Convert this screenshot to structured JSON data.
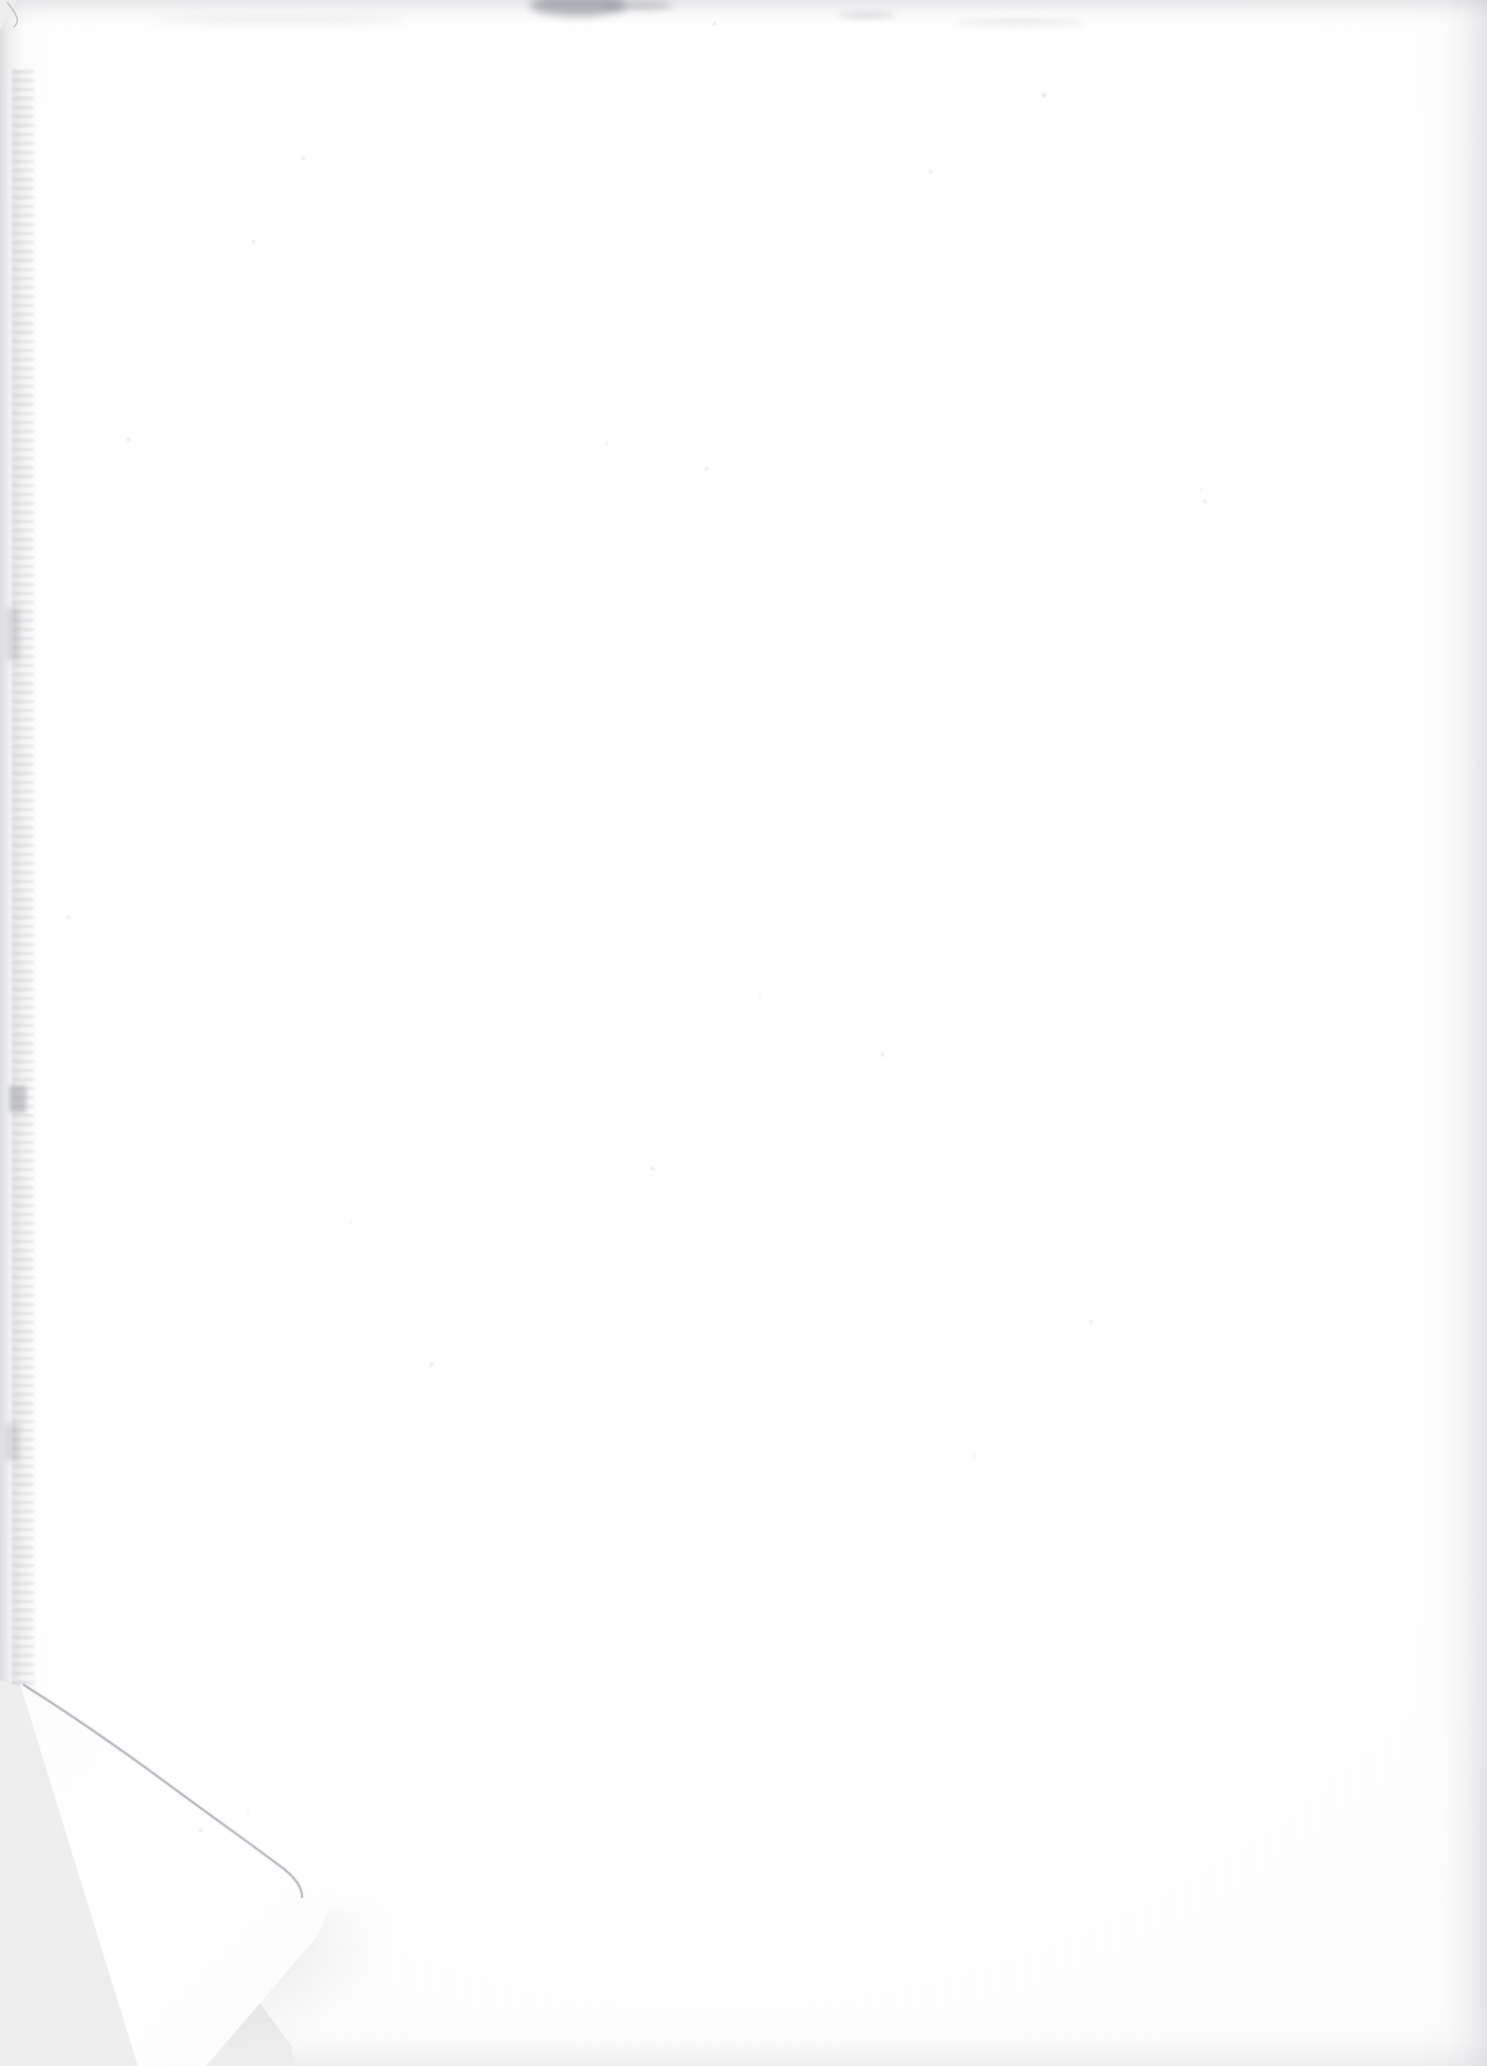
{
  "document": {
    "kind": "scanned-page",
    "page_content_text": "",
    "is_blank": true,
    "orientation": "portrait",
    "width_px": 1487,
    "height_px": 2066
  },
  "colors": {
    "paper_white": "#ffffff",
    "paper_tone": "#fdfdfd",
    "scanner_backdrop": "#eeeeee",
    "edge_shadow": "#c4c6ca",
    "fold_crease_line": "#9a9da4",
    "top_smudge": "#767a84",
    "left_grain": "#b0b2b7"
  },
  "artifacts": {
    "folded_corner": {
      "name": "bottom-left-folded-corner",
      "position": "bottom-left",
      "apex_x_px": 300,
      "apex_y_px": 1905,
      "hinge_x_px": 22,
      "hinge_y_px": 1686
    },
    "corner_nick": {
      "name": "top-left-corner-nick",
      "position": "top-left",
      "size_px": 30
    },
    "smudges": [
      {
        "name": "top-edge-dark-smudge",
        "x_px": 530,
        "y_px": 0,
        "width_px": 96
      },
      {
        "name": "top-edge-tail-smudge",
        "x_px": 600,
        "y_px": 1,
        "width_px": 74
      },
      {
        "name": "top-edge-right-streak",
        "x_px": 838,
        "y_px": 12,
        "width_px": 58
      },
      {
        "name": "top-edge-far-right-streak",
        "x_px": 955,
        "y_px": 20,
        "width_px": 130
      },
      {
        "name": "top-edge-left-streak",
        "x_px": 150,
        "y_px": 16,
        "width_px": 260
      }
    ],
    "specks": [
      {
        "x_px": 1042,
        "y_px": 93,
        "size_px": 4
      },
      {
        "x_px": 713,
        "y_px": 22,
        "size_px": 3
      },
      {
        "x_px": 929,
        "y_px": 170,
        "size_px": 3
      },
      {
        "x_px": 1203,
        "y_px": 500,
        "size_px": 3
      },
      {
        "x_px": 1200,
        "y_px": 489,
        "size_px": 2
      },
      {
        "x_px": 705,
        "y_px": 467,
        "size_px": 3
      },
      {
        "x_px": 127,
        "y_px": 438,
        "size_px": 3
      },
      {
        "x_px": 606,
        "y_px": 442,
        "size_px": 2
      },
      {
        "x_px": 67,
        "y_px": 916,
        "size_px": 3
      },
      {
        "x_px": 252,
        "y_px": 240,
        "size_px": 3
      },
      {
        "x_px": 302,
        "y_px": 157,
        "size_px": 3
      },
      {
        "x_px": 651,
        "y_px": 1167,
        "size_px": 3
      },
      {
        "x_px": 881,
        "y_px": 1053,
        "size_px": 3
      },
      {
        "x_px": 759,
        "y_px": 994,
        "size_px": 2
      },
      {
        "x_px": 350,
        "y_px": 1222,
        "size_px": 2
      },
      {
        "x_px": 430,
        "y_px": 1363,
        "size_px": 3
      },
      {
        "x_px": 974,
        "y_px": 1455,
        "size_px": 2
      },
      {
        "x_px": 199,
        "y_px": 1829,
        "size_px": 3
      },
      {
        "x_px": 247,
        "y_px": 1810,
        "size_px": 2
      },
      {
        "x_px": 118,
        "y_px": 1749,
        "size_px": 2
      },
      {
        "x_px": 1090,
        "y_px": 1320,
        "size_px": 3
      }
    ],
    "edge_shadows": [
      "left",
      "top",
      "right",
      "bottom"
    ]
  },
  "labels": {
    "page_alt": "Blank scanned page with folded bottom-left corner"
  }
}
